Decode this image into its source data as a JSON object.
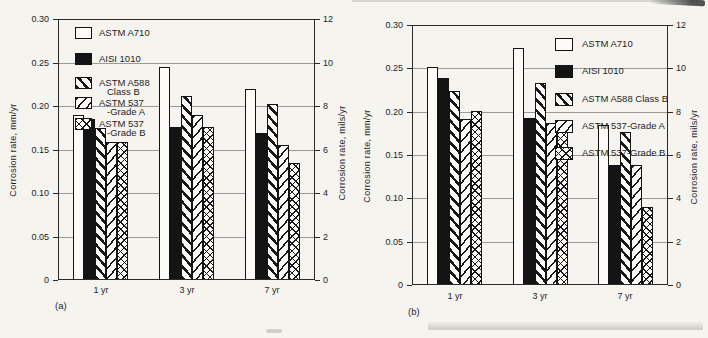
{
  "page": {
    "background": "#f5f4ef",
    "ink": "#1f1f1f",
    "grid_color": "#9a9a9a"
  },
  "chart_data": [
    {
      "id": "a",
      "type": "bar",
      "panel_label": "(a)",
      "categories": [
        "1 yr",
        "3 yr",
        "7 yr"
      ],
      "series": [
        {
          "name": "ASTM A710",
          "legend_lines": [
            "ASTM A710"
          ],
          "pattern": "open",
          "values": [
            0.19,
            0.245,
            0.22
          ]
        },
        {
          "name": "AISI 1010",
          "legend_lines": [
            "AISI 1010"
          ],
          "pattern": "solid",
          "values": [
            0.185,
            0.176,
            0.169
          ]
        },
        {
          "name": "ASTM A588 Class B",
          "legend_lines": [
            "ASTM A588",
            "Class B"
          ],
          "pattern": "hatch-nw",
          "values": [
            0.175,
            0.212,
            0.202
          ]
        },
        {
          "name": "ASTM 537-Grade A",
          "legend_lines": [
            "ASTM 537",
            "-Grade A"
          ],
          "pattern": "hatch-ne",
          "values": [
            0.159,
            0.19,
            0.155
          ]
        },
        {
          "name": "ASTM 537-Grade B",
          "legend_lines": [
            "ASTM 537",
            "-Grade B"
          ],
          "pattern": "cross",
          "values": [
            0.159,
            0.176,
            0.134
          ]
        }
      ],
      "ylabel_left": "Corrosion rate, mm/yr",
      "ylabel_right": "Corrosion rate, mils/yr",
      "ylim_left": [
        0,
        0.3
      ],
      "ylim_right": [
        0,
        12
      ],
      "yticks_left": [
        "0",
        "0.05",
        "0.10",
        "0.15",
        "0.20",
        "0.25",
        "0.30"
      ],
      "yticks_right": [
        "0",
        "2",
        "4",
        "6",
        "8",
        "10",
        "12"
      ],
      "grid": "horizontal",
      "legend_position": "inside-top-left"
    },
    {
      "id": "b",
      "type": "bar",
      "panel_label": "(b)",
      "categories": [
        "1 yr",
        "3 yr",
        "7 yr"
      ],
      "series": [
        {
          "name": "ASTM A710",
          "legend_lines": [
            "ASTM A710"
          ],
          "pattern": "open",
          "values": [
            0.252,
            0.274,
            0.185
          ]
        },
        {
          "name": "AISI 1010",
          "legend_lines": [
            "AISI 1010"
          ],
          "pattern": "solid",
          "values": [
            0.239,
            0.193,
            0.138
          ]
        },
        {
          "name": "ASTM A588 Class B",
          "legend_lines": [
            "ASTM A588 Class B"
          ],
          "pattern": "hatch-nw",
          "values": [
            0.224,
            0.233,
            0.177
          ]
        },
        {
          "name": "ASTM 537-Grade A",
          "legend_lines": [
            "ASTM 537-Grade A"
          ],
          "pattern": "hatch-ne",
          "values": [
            0.191,
            0.187,
            0.139
          ]
        },
        {
          "name": "ASTM 537-Grade B",
          "legend_lines": [
            "ASTM 537-Grade B"
          ],
          "pattern": "cross",
          "values": [
            0.201,
            0.176,
            0.09
          ]
        }
      ],
      "ylabel_left": "Corrosion rate, mm/yr",
      "ylabel_right": "Corrosion rate, mils/yr",
      "ylim_left": [
        0,
        0.3
      ],
      "ylim_right": [
        0,
        12
      ],
      "yticks_left": [
        "0",
        "0.05",
        "0.10",
        "0.15",
        "0.20",
        "0.25",
        "0.30"
      ],
      "yticks_right": [
        "0",
        "2",
        "4",
        "6",
        "8",
        "10",
        "12"
      ],
      "grid": "horizontal",
      "legend_position": "inside-top-right"
    }
  ]
}
